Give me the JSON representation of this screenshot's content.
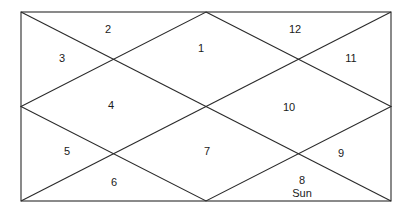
{
  "diagram": {
    "type": "north-indian-horoscope-chart",
    "houses": [
      {
        "number": "1",
        "x": 201,
        "y": 48
      },
      {
        "number": "2",
        "x": 108,
        "y": 29
      },
      {
        "number": "3",
        "x": 62,
        "y": 58
      },
      {
        "number": "4",
        "x": 111,
        "y": 105
      },
      {
        "number": "5",
        "x": 67,
        "y": 151
      },
      {
        "number": "6",
        "x": 114,
        "y": 182
      },
      {
        "number": "7",
        "x": 207,
        "y": 151
      },
      {
        "number": "8",
        "x": 302,
        "y": 180
      },
      {
        "number": "9",
        "x": 341,
        "y": 153
      },
      {
        "number": "10",
        "x": 289,
        "y": 107
      },
      {
        "number": "11",
        "x": 351,
        "y": 58
      },
      {
        "number": "12",
        "x": 295,
        "y": 29
      }
    ],
    "planets": [
      {
        "name": "Sun",
        "house": "8",
        "x": 302,
        "y": 193
      }
    ],
    "frame": {
      "x1": 21,
      "y1": 12,
      "x2": 391,
      "y2": 201
    },
    "line_color": "#2a2a2a"
  }
}
